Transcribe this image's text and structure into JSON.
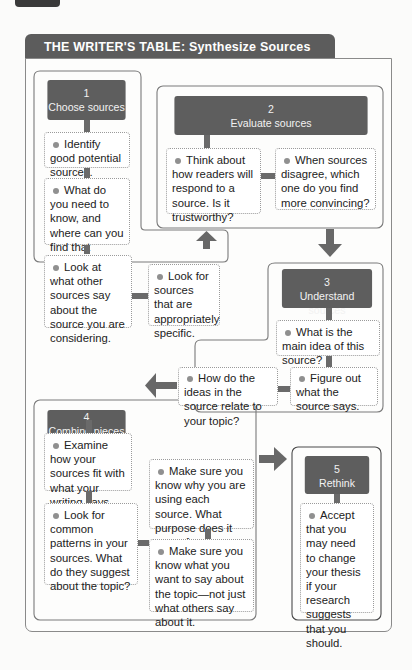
{
  "title": "THE WRITER'S TABLE: Synthesize Sources",
  "colors": {
    "header_bg": "#5e5e5e",
    "title_bg": "#5c5c5c",
    "border": "#8a8a8a",
    "dot": "#909090",
    "arrow": "#6a6a6a"
  },
  "steps": [
    {
      "number": "1",
      "label": "Choose sources",
      "notes": [
        "Identify good potential sources.",
        "What do you need to know, and where can you find that information?",
        "Look at what other sources say about the source you are considering.",
        "Look for sources that are appropriately specific."
      ]
    },
    {
      "number": "2",
      "label": "Evaluate sources",
      "notes": [
        "Think about how readers will respond to a source. Is it trustworthy?",
        "When sources disagree, which one do you find more convincing?"
      ]
    },
    {
      "number": "3",
      "label": "Understand sources",
      "notes": [
        "What is the main idea of this source?",
        "Figure out what the source says.",
        "How do the ideas in the source relate to your topic?"
      ]
    },
    {
      "number": "4",
      "label": "Combine pieces",
      "notes": [
        "Examine how your sources fit with what your writing says.",
        "Look for common patterns in your sources. What do they suggest about the topic?",
        "Make sure you know why you are using each source. What purpose does it serve for your writing?",
        "Make sure you know what you want to say about the topic—not just what others say about it."
      ]
    },
    {
      "number": "5",
      "label": "Rethink",
      "notes": [
        "Accept that you may need to change your thesis if your research suggests that you should."
      ]
    }
  ],
  "arrows": [
    {
      "from": "1",
      "to": "2",
      "direction": "up"
    },
    {
      "from": "2",
      "to": "3",
      "direction": "down"
    },
    {
      "from": "3",
      "to": "4",
      "direction": "left"
    },
    {
      "from": "4",
      "to": "5",
      "direction": "right"
    }
  ]
}
